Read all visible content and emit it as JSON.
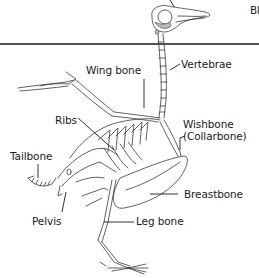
{
  "diagram": {
    "header_label_partial": "Bl",
    "divider_color": "#1a1a1a",
    "labels": {
      "wing_bone": "Wing bone",
      "vertebrae": "Vertebrae",
      "ribs": "Ribs",
      "wishbone": "Wishbone",
      "collarbone": "(Collarbone)",
      "tailbone": "Tailbone",
      "breastbone": "Breastbone",
      "pelvis": "Pelvis",
      "leg_bone": "Leg bone"
    }
  }
}
